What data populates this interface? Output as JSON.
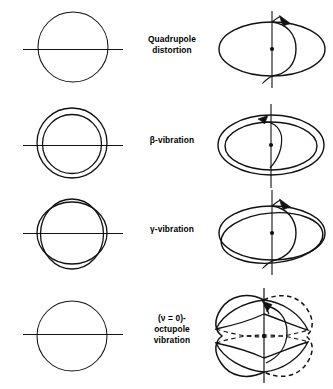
{
  "figure": {
    "stroke_color": "#111111",
    "background_color": "#ffffff",
    "columns": [
      {
        "name": "cross-section-view",
        "description": "circular / elliptical cross section with horizontal symmetry axis"
      },
      {
        "name": "perspective-view",
        "description": "three-dimensional perspective with vertical symmetry axis, centre dot and curved rotation arrow"
      }
    ],
    "rows": [
      {
        "id": "quadrupole-distortion",
        "label_lines": [
          "Quadrupole",
          "distortion"
        ],
        "left_shape": "single-circle",
        "right_shape": "single-oblate-ellipsoid",
        "has_axis": true,
        "has_center_dot": true,
        "has_rotation_arrow": true,
        "has_dashed_contour": false
      },
      {
        "id": "beta-vibration",
        "label_lines": [
          "β-vibration"
        ],
        "left_shape": "two-concentric-circles",
        "right_shape": "two-nested-ellipsoids",
        "has_axis": true,
        "has_center_dot": true,
        "has_rotation_arrow": true,
        "has_dashed_contour": false
      },
      {
        "id": "gamma-vibration",
        "label_lines": [
          "γ-vibration"
        ],
        "left_shape": "two-crossing-ellipses",
        "right_shape": "two-crossing-ellipsoids",
        "has_axis": true,
        "has_center_dot": true,
        "has_rotation_arrow": true,
        "has_dashed_contour": false
      },
      {
        "id": "nu-0-octupole-vibration",
        "label_lines": [
          "(ν = 0)-",
          "octupole",
          "vibration"
        ],
        "left_shape": "single-circle",
        "right_shape": "four-lobed-octupole",
        "has_axis": true,
        "has_center_dot": true,
        "has_rotation_arrow": true,
        "has_dashed_contour": true
      }
    ]
  }
}
